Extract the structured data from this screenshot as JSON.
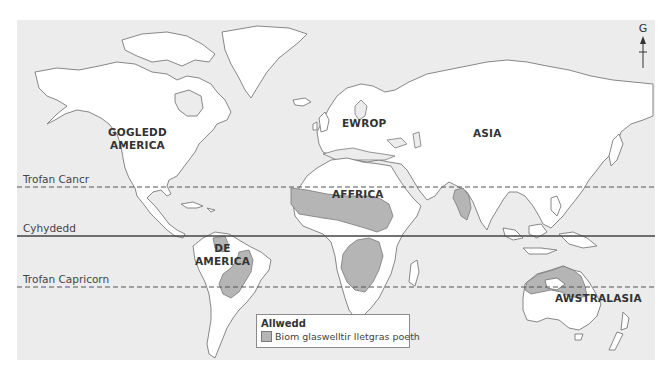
{
  "map": {
    "title": "",
    "ocean_color": "#ececec",
    "land_color": "#ffffff",
    "highlight_color": "#b5b5b5"
  },
  "lines": {
    "tropic_of_cancer": "Trofan Cancr",
    "equator": "Cyhydedd",
    "tropic_of_capricorn": "Trofan Capricorn"
  },
  "continents": {
    "north_america": [
      "GOGLEDD",
      "AMERICA"
    ],
    "south_america": [
      "DE",
      "AMERICA"
    ],
    "europe": "EWROP",
    "asia": "ASIA",
    "africa": "AFFRICA",
    "australasia": "AWSTRALASIA"
  },
  "compass": {
    "label": "G",
    "icon": "north-arrow-icon"
  },
  "legend": {
    "title": "Allwedd",
    "items": [
      {
        "label": "Biom glaswelltir lletgras poeth",
        "color": "#b5b5b5"
      }
    ]
  }
}
